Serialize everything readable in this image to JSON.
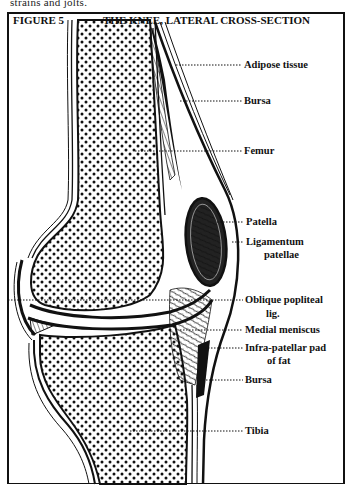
{
  "page": {
    "top_text": "strains and jolts."
  },
  "figure": {
    "number": "FIGURE 5",
    "title": "THE KNEE, LATERAL CROSS-SECTION"
  },
  "labels": [
    {
      "id": "adipose-tissue",
      "text": "Adipose tissue"
    },
    {
      "id": "bursa-upper",
      "text": "Bursa"
    },
    {
      "id": "femur",
      "text": "Femur"
    },
    {
      "id": "patella",
      "text": "Patella"
    },
    {
      "id": "ligamentum-patellae",
      "text": "Ligamentum",
      "text2": "patellae"
    },
    {
      "id": "oblique-popliteal-lig",
      "text": "Oblique popliteal",
      "text2": "lig."
    },
    {
      "id": "medial-meniscus",
      "text": "Medial meniscus"
    },
    {
      "id": "infra-patellar-pad",
      "text": "Infra-patellar pad",
      "text2": "of fat"
    },
    {
      "id": "bursa-lower",
      "text": "Bursa"
    },
    {
      "id": "tibia",
      "text": "Tibia"
    }
  ],
  "colors": {
    "ink": "#111111",
    "paper": "#ffffff"
  }
}
